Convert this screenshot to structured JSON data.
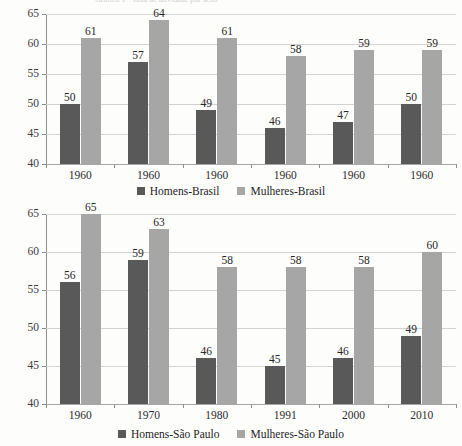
{
  "document": {
    "title_clipped": "Gráfico 1 - Taxa de atividade por sexo"
  },
  "charts": [
    {
      "id": "brasil",
      "legend": [
        {
          "label": "Homens-Brasil",
          "swatch": "men"
        },
        {
          "label": "Mulheres-Brasil",
          "swatch": "women"
        }
      ],
      "y_ticks": [
        "65",
        "60",
        "55",
        "50",
        "45",
        "40"
      ],
      "x_labels": [
        "1960",
        "1960",
        "1960",
        "1960",
        "1960",
        "1960"
      ]
    },
    {
      "id": "sao-paulo",
      "legend": [
        {
          "label": "Homens-São Paulo",
          "swatch": "men"
        },
        {
          "label": "Mulheres-São Paulo",
          "swatch": "women"
        }
      ],
      "y_ticks": [
        "65",
        "60",
        "55",
        "50",
        "45",
        "40"
      ],
      "x_labels": [
        "1960",
        "1970",
        "1980",
        "1991",
        "2000",
        "2010"
      ]
    }
  ],
  "chart_data": [
    {
      "type": "bar",
      "title": "",
      "xlabel": "",
      "ylabel": "",
      "categories": [
        "1960",
        "1960",
        "1960",
        "1960",
        "1960",
        "1960"
      ],
      "series": [
        {
          "name": "Homens-Brasil",
          "color": "#595959",
          "values": [
            50,
            57,
            49,
            46,
            47,
            50
          ]
        },
        {
          "name": "Mulheres-Brasil",
          "color": "#a6a6a6",
          "values": [
            61,
            64,
            61,
            58,
            59,
            59
          ]
        }
      ],
      "ylim": [
        40,
        65
      ],
      "ytick_step": 5,
      "grid": true,
      "legend_position": "bottom",
      "data_labels": true
    },
    {
      "type": "bar",
      "title": "",
      "xlabel": "",
      "ylabel": "",
      "categories": [
        "1960",
        "1970",
        "1980",
        "1991",
        "2000",
        "2010"
      ],
      "series": [
        {
          "name": "Homens-São Paulo",
          "color": "#595959",
          "values": [
            56,
            59,
            46,
            45,
            46,
            49
          ]
        },
        {
          "name": "Mulheres-São Paulo",
          "color": "#a6a6a6",
          "values": [
            65,
            63,
            58,
            58,
            58,
            60
          ]
        }
      ],
      "ylim": [
        40,
        65
      ],
      "ytick_step": 5,
      "grid": true,
      "legend_position": "bottom",
      "data_labels": true
    }
  ]
}
